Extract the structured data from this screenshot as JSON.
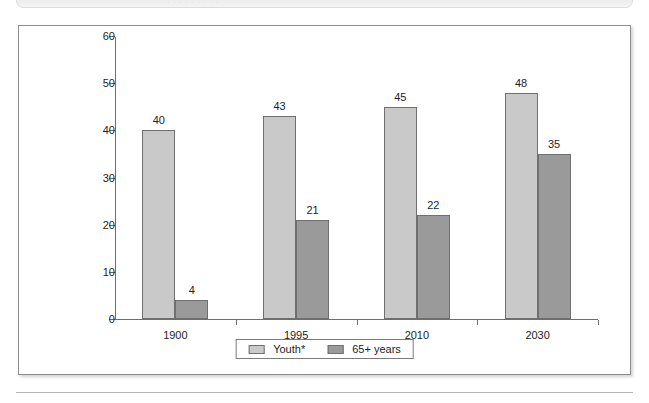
{
  "banner": {
    "ghost_text": "· · ·   ·   ·      ·    ·   ·   ·"
  },
  "colors": {
    "youth_fill": "#c9c9c9",
    "older_fill": "#9a9a9a",
    "bar_outline": "#6f6f6f",
    "axis": "#6e6e6e",
    "frame_border": "#8d8d8d",
    "text": "#1d1d1d"
  },
  "chart_data": {
    "type": "bar",
    "title": "",
    "subtitle": "",
    "xlabel": "",
    "ylabel": "",
    "categories": [
      "1900",
      "1995",
      "2010",
      "2030"
    ],
    "series": [
      {
        "name": "Youth*",
        "values": [
          40,
          43,
          45,
          48
        ],
        "color": "#c9c9c9"
      },
      {
        "name": "65+ years",
        "values": [
          4,
          21,
          22,
          35
        ],
        "color": "#9a9a9a"
      }
    ],
    "ylim": [
      0,
      60
    ],
    "yticks": [
      0,
      10,
      20,
      30,
      40,
      50,
      60
    ],
    "ytick_labels": [
      "0",
      "10",
      "20",
      "30",
      "40",
      "50",
      "60"
    ],
    "grid": false,
    "legend_position": "bottom-center",
    "data_labels": true,
    "annotations": []
  }
}
